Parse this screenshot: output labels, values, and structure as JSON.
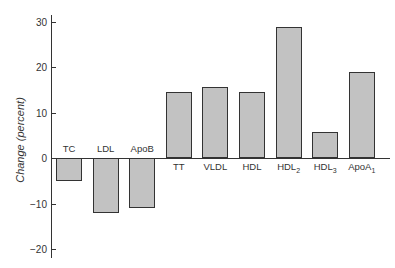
{
  "chart_data": {
    "type": "bar",
    "title": "",
    "xlabel": "",
    "ylabel": "Change (percent)",
    "ylim": [
      -20,
      30
    ],
    "yticks": [
      30,
      20,
      10,
      0,
      -10,
      -20
    ],
    "grid": false,
    "legend": null,
    "categories": [
      "TC",
      "LDL",
      "ApoB",
      "TT",
      "VLDL",
      "HDL",
      "HDL2",
      "HDL3",
      "ApoA1"
    ],
    "category_display": [
      {
        "base": "TC",
        "sub": ""
      },
      {
        "base": "LDL",
        "sub": ""
      },
      {
        "base": "ApoB",
        "sub": ""
      },
      {
        "base": "TT",
        "sub": ""
      },
      {
        "base": "VLDL",
        "sub": ""
      },
      {
        "base": "HDL",
        "sub": ""
      },
      {
        "base": "HDL",
        "sub": "2"
      },
      {
        "base": "HDL",
        "sub": "3"
      },
      {
        "base": "ApoA",
        "sub": "1"
      }
    ],
    "values": [
      -5,
      -12,
      -11,
      14.5,
      15.5,
      14.5,
      28.8,
      5.8,
      18.8
    ],
    "bar_color": "#c2c2c2",
    "edge_color": "#333333"
  }
}
